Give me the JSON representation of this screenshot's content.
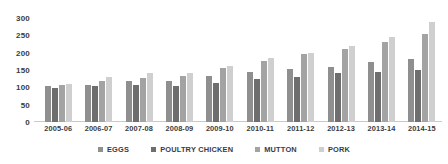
{
  "chart_data": {
    "type": "bar",
    "title": "",
    "xlabel": "",
    "ylabel": "",
    "ylim": [
      0,
      300
    ],
    "yticks": [
      300,
      250,
      200,
      150,
      100,
      50,
      0
    ],
    "grid": false,
    "legend_position": "bottom",
    "categories": [
      "2005-06",
      "2006-07",
      "2007-08",
      "2008-09",
      "2009-10",
      "2010-11",
      "2011-12",
      "2012-13",
      "2013-14",
      "2014-15"
    ],
    "series": [
      {
        "name": "EGGS",
        "color": "#8f8f8f",
        "values": [
          103,
          107,
          118,
          118,
          132,
          143,
          153,
          160,
          172,
          182
        ]
      },
      {
        "name": "POULTRY CHICKEN",
        "color": "#6e6e6e",
        "values": [
          97,
          103,
          107,
          104,
          112,
          125,
          130,
          140,
          143,
          150
        ]
      },
      {
        "name": "MUTTON",
        "color": "#a3a3a3",
        "values": [
          107,
          117,
          128,
          132,
          155,
          175,
          195,
          210,
          230,
          255
        ]
      },
      {
        "name": "PORK",
        "color": "#cfcfcf",
        "values": [
          110,
          130,
          140,
          142,
          163,
          185,
          200,
          220,
          245,
          288
        ]
      }
    ]
  }
}
